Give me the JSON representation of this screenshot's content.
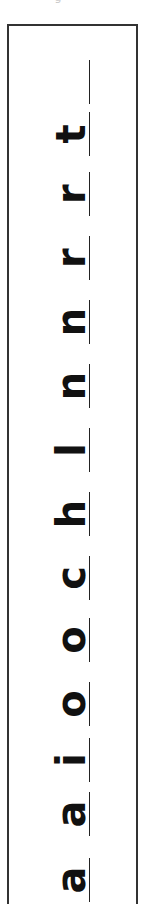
{
  "worksheet": {
    "top_fragment": "g",
    "letters": [
      "t",
      "r",
      "r",
      "n",
      "n",
      "l",
      "h",
      "c",
      "o",
      "o",
      "i",
      "a",
      "a"
    ],
    "blank_lines": 1,
    "orientation": "rotated 90 degrees (reads bottom to top)",
    "colors": {
      "ink": "#111111",
      "border": "#333333",
      "paper": "#ffffff"
    }
  }
}
